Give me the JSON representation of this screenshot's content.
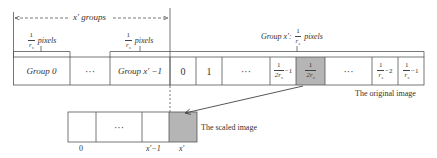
{
  "diagram": {
    "top_span_label": "x′ groups",
    "bracket_group0_label": {
      "num": "1",
      "den": "r",
      "sub": "s",
      "suffix": "pixels"
    },
    "bracket_groupx1_label": {
      "num": "1",
      "den": "r",
      "sub": "s",
      "suffix": "pixels"
    },
    "bracket_groupx_label": {
      "prefix": "Group x′:",
      "num": "1",
      "den": "r",
      "sub": "s",
      "suffix": "pixels"
    },
    "original_image": {
      "caption": "The original image",
      "cells": [
        {
          "label": "Group 0",
          "highlight": false
        },
        {
          "label": "···",
          "highlight": false
        },
        {
          "label": "Group x′ −1",
          "highlight": false
        },
        {
          "label": "0",
          "highlight": false
        },
        {
          "label": "1",
          "highlight": false
        },
        {
          "label": "···",
          "highlight": false
        },
        {
          "label": "1/(2r_s) −1",
          "num": "1",
          "den": "2r",
          "sub": "s",
          "tail": "−1",
          "highlight": false
        },
        {
          "label": "1/(2r_s)",
          "num": "1",
          "den": "2r",
          "sub": "s",
          "tail": "",
          "highlight": true
        },
        {
          "label": "···",
          "highlight": false
        },
        {
          "label": "1/r_s −2",
          "num": "1",
          "den": "r",
          "sub": "s",
          "tail": "−2",
          "highlight": false
        },
        {
          "label": "1/r_s −1",
          "num": "1",
          "den": "r",
          "sub": "s",
          "tail": "−1",
          "highlight": false
        }
      ]
    },
    "scaled_image": {
      "caption": "The scaled image",
      "cells": [
        {
          "label": "",
          "index": "0",
          "highlight": false
        },
        {
          "label": "···",
          "index": "",
          "highlight": false
        },
        {
          "label": "",
          "index": "x′−1",
          "highlight": false
        },
        {
          "label": "",
          "index": "x′",
          "highlight": true
        }
      ]
    },
    "colors": {
      "line": "#555555",
      "highlight_fill": "#b5b5b5",
      "text": "#333333"
    }
  }
}
